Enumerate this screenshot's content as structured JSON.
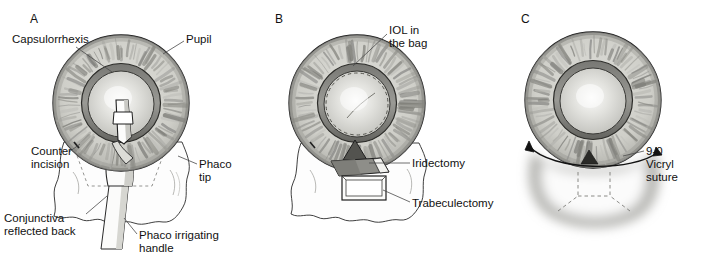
{
  "figure": {
    "background_color": "#ffffff",
    "width": 728,
    "height": 257
  },
  "palette": {
    "outline": "#1a1a1a",
    "iris_light": "#e2e2de",
    "iris_mid": "#b9b9b4",
    "iris_dark": "#8d8d88",
    "limbus_ring": "#7d7d78",
    "pupil_ring_dark": "#6e6e6a",
    "pupil_ring_darker": "#4f4f4c",
    "lens_light": "#f0f0ee",
    "lens_mid": "#cfcfcb",
    "sclera": "#fdfdfd",
    "conjunctiva_line": "#2a2a2a",
    "instrument_fill": "#fbfbfa",
    "instrument_shade": "#a9a9a4",
    "flap_fill": "#8a8a85",
    "flap_dark": "#5f5f5b",
    "bleb_halo": "#b5b5b0",
    "leader_line": "#4a4a4a",
    "dashed_line": "#6a6a66"
  },
  "panels": [
    {
      "id": "A",
      "letter": "A",
      "letter_pos": {
        "x": 30,
        "y": 12
      },
      "caption_topic": "Phacoemulsification through superior incision",
      "labels": [
        {
          "name": "capsulorrhexis",
          "text": "Capsulorrhexis",
          "x": 12,
          "y": 33,
          "align": "left",
          "leader": {
            "x1": 76,
            "y1": 47,
            "x2": 112,
            "y2": 72
          }
        },
        {
          "name": "pupil",
          "text": "Pupil",
          "x": 186,
          "y": 33,
          "align": "left",
          "leader": {
            "x1": 184,
            "y1": 41,
            "x2": 163,
            "y2": 52
          }
        },
        {
          "name": "counter-incision",
          "text": "Counter\nincision",
          "x": 31,
          "y": 145,
          "align": "left",
          "leader": {
            "x1": 69,
            "y1": 152,
            "x2": 80,
            "y2": 143
          }
        },
        {
          "name": "phaco-tip",
          "text": "Phaco\ntip",
          "x": 199,
          "y": 158,
          "align": "left",
          "leader": {
            "x1": 197,
            "y1": 164,
            "x2": 176,
            "y2": 156
          }
        },
        {
          "name": "conjunctiva-reflected-back",
          "text": "Conjunctiva\nreflected back",
          "x": 4,
          "y": 212,
          "align": "left",
          "leader": {
            "x1": 86,
            "y1": 214,
            "x2": 104,
            "y2": 198
          }
        },
        {
          "name": "phaco-irrigating-handle",
          "text": "Phaco irrigating\nhandle",
          "x": 139,
          "y": 229,
          "align": "left",
          "leader": {
            "x1": 137,
            "y1": 234,
            "x2": 124,
            "y2": 219
          }
        }
      ]
    },
    {
      "id": "B",
      "letter": "B",
      "letter_pos": {
        "x": 32,
        "y": 12
      },
      "caption_topic": "Intraocular lens in the capsular bag with iridectomy and trabeculectomy",
      "labels": [
        {
          "name": "iol-in-the-bag",
          "text": "IOL in\nthe bag",
          "x": 146,
          "y": 24,
          "align": "left",
          "leader": {
            "x1": 144,
            "y1": 32,
            "x2": 112,
            "y2": 62
          }
        },
        {
          "name": "iridectomy",
          "text": "Iridectomy",
          "x": 169,
          "y": 157,
          "align": "left",
          "leader": {
            "x1": 167,
            "y1": 163,
            "x2": 120,
            "y2": 163
          }
        },
        {
          "name": "trabeculectomy",
          "text": "Trabeculectomy",
          "x": 169,
          "y": 197,
          "align": "left",
          "leader": {
            "x1": 167,
            "y1": 202,
            "x2": 124,
            "y2": 185
          }
        }
      ]
    },
    {
      "id": "C",
      "letter": "C",
      "letter_pos": {
        "x": 35,
        "y": 12
      },
      "caption_topic": "Closure with suture and resulting filtering bleb",
      "labels": [
        {
          "name": "vicryl-suture",
          "text": "9-0\nVicryl\nsuture",
          "x": 160,
          "y": 145,
          "align": "left",
          "leader": {
            "x1": 158,
            "y1": 151,
            "x2": 137,
            "y2": 157
          }
        }
      ]
    }
  ],
  "anatomy": {
    "eye": {
      "center_x": 121,
      "center_y": 103,
      "iris_radius": 68,
      "pupil_outer_radius": 39,
      "pupil_inner_radius": 33,
      "lens_radius": 32,
      "striation_count": 72
    },
    "structures": [
      {
        "name": "iris",
        "description": "radially striated annulus"
      },
      {
        "name": "pupil-margin",
        "description": "dark gray ring"
      },
      {
        "name": "lens",
        "description": "central light radial gradient sphere"
      },
      {
        "name": "conjunctiva-flap",
        "description": "irregular reflected flap inferior to globe"
      },
      {
        "name": "scleral-flap",
        "description": "trapezoidal flap over trabeculectomy site"
      },
      {
        "name": "filtering-bleb",
        "description": "soft diffuse halo below limbus"
      }
    ]
  }
}
